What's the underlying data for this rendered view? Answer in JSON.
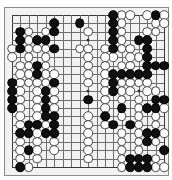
{
  "board": {
    "name": "go-board",
    "size": 19,
    "origin_x": 7,
    "origin_y": 7,
    "spacing": 8.45,
    "board_color": "#f2f2f2",
    "line_color": "#6e6e6e",
    "edge_color": "#3a3a3a",
    "black_color": "#101010",
    "white_color": "#fdfdfd",
    "stone_diameter": 9.6,
    "star_points": [
      [
        3,
        3
      ],
      [
        9,
        3
      ],
      [
        15,
        3
      ],
      [
        3,
        9
      ],
      [
        9,
        9
      ],
      [
        15,
        9
      ],
      [
        3,
        15
      ],
      [
        9,
        15
      ],
      [
        15,
        15
      ]
    ]
  },
  "stones": {
    "black": [
      [
        12,
        0
      ],
      [
        17,
        0
      ],
      [
        8,
        1
      ],
      [
        12,
        1
      ],
      [
        5,
        1
      ],
      [
        1,
        2
      ],
      [
        1,
        3
      ],
      [
        3,
        3
      ],
      [
        4,
        3
      ],
      [
        5,
        2
      ],
      [
        12,
        2
      ],
      [
        12,
        3
      ],
      [
        12,
        4
      ],
      [
        15,
        3
      ],
      [
        16,
        3
      ],
      [
        16,
        4
      ],
      [
        1,
        4
      ],
      [
        5,
        4
      ],
      [
        16,
        5
      ],
      [
        3,
        6
      ],
      [
        3,
        7
      ],
      [
        16,
        6
      ],
      [
        17,
        6
      ],
      [
        18,
        6
      ],
      [
        12,
        7
      ],
      [
        13,
        7
      ],
      [
        14,
        7
      ],
      [
        15,
        7
      ],
      [
        16,
        7
      ],
      [
        0,
        8
      ],
      [
        0,
        9
      ],
      [
        0,
        10
      ],
      [
        0,
        11
      ],
      [
        5,
        8
      ],
      [
        12,
        8
      ],
      [
        12,
        9
      ],
      [
        4,
        9
      ],
      [
        4,
        10
      ],
      [
        4,
        11
      ],
      [
        9,
        10
      ],
      [
        17,
        10
      ],
      [
        18,
        10
      ],
      [
        16,
        11
      ],
      [
        17,
        11
      ],
      [
        4,
        12
      ],
      [
        5,
        12
      ],
      [
        2,
        13
      ],
      [
        3,
        13
      ],
      [
        5,
        13
      ],
      [
        11,
        12
      ],
      [
        13,
        11
      ],
      [
        1,
        14
      ],
      [
        2,
        14
      ],
      [
        4,
        14
      ],
      [
        5,
        14
      ],
      [
        12,
        13
      ],
      [
        14,
        13
      ],
      [
        16,
        14
      ],
      [
        17,
        14
      ],
      [
        2,
        16
      ],
      [
        16,
        15
      ],
      [
        1,
        18
      ],
      [
        14,
        17
      ],
      [
        15,
        17
      ],
      [
        16,
        17
      ],
      [
        14,
        18
      ],
      [
        15,
        18
      ],
      [
        16,
        18
      ],
      [
        18,
        16
      ]
    ],
    "white": [
      [
        13,
        0
      ],
      [
        14,
        0
      ],
      [
        16,
        0
      ],
      [
        18,
        0
      ],
      [
        13,
        1
      ],
      [
        17,
        1
      ],
      [
        18,
        1
      ],
      [
        2,
        2
      ],
      [
        4,
        2
      ],
      [
        9,
        2
      ],
      [
        13,
        2
      ],
      [
        17,
        2
      ],
      [
        2,
        3
      ],
      [
        13,
        3
      ],
      [
        0,
        4
      ],
      [
        2,
        4
      ],
      [
        3,
        4
      ],
      [
        4,
        4
      ],
      [
        8,
        4
      ],
      [
        9,
        4
      ],
      [
        11,
        4
      ],
      [
        12,
        5
      ],
      [
        13,
        4
      ],
      [
        14,
        4
      ],
      [
        16,
        2
      ],
      [
        0,
        5
      ],
      [
        2,
        5
      ],
      [
        4,
        5
      ],
      [
        9,
        5
      ],
      [
        11,
        5
      ],
      [
        14,
        5
      ],
      [
        15,
        5
      ],
      [
        1,
        6
      ],
      [
        2,
        6
      ],
      [
        4,
        6
      ],
      [
        9,
        6
      ],
      [
        11,
        6
      ],
      [
        13,
        6
      ],
      [
        14,
        6
      ],
      [
        1,
        7
      ],
      [
        2,
        7
      ],
      [
        4,
        7
      ],
      [
        5,
        7
      ],
      [
        9,
        7
      ],
      [
        11,
        7
      ],
      [
        1,
        8
      ],
      [
        2,
        8
      ],
      [
        3,
        8
      ],
      [
        4,
        8
      ],
      [
        9,
        8
      ],
      [
        11,
        8
      ],
      [
        13,
        8
      ],
      [
        14,
        8
      ],
      [
        15,
        8
      ],
      [
        16,
        8
      ],
      [
        1,
        9
      ],
      [
        3,
        9
      ],
      [
        5,
        9
      ],
      [
        11,
        9
      ],
      [
        13,
        9
      ],
      [
        14,
        9
      ],
      [
        16,
        9
      ],
      [
        17,
        9
      ],
      [
        1,
        10
      ],
      [
        3,
        10
      ],
      [
        5,
        10
      ],
      [
        11,
        10
      ],
      [
        13,
        10
      ],
      [
        15,
        10
      ],
      [
        1,
        11
      ],
      [
        3,
        11
      ],
      [
        5,
        11
      ],
      [
        11,
        11
      ],
      [
        15,
        11
      ],
      [
        18,
        11
      ],
      [
        1,
        12
      ],
      [
        3,
        12
      ],
      [
        9,
        12
      ],
      [
        13,
        12
      ],
      [
        15,
        12
      ],
      [
        17,
        12
      ],
      [
        1,
        13
      ],
      [
        4,
        13
      ],
      [
        9,
        13
      ],
      [
        11,
        13
      ],
      [
        15,
        13
      ],
      [
        17,
        13
      ],
      [
        3,
        14
      ],
      [
        9,
        14
      ],
      [
        13,
        14
      ],
      [
        15,
        14
      ],
      [
        18,
        14
      ],
      [
        1,
        15
      ],
      [
        3,
        15
      ],
      [
        5,
        15
      ],
      [
        9,
        15
      ],
      [
        13,
        15
      ],
      [
        15,
        15
      ],
      [
        17,
        15
      ],
      [
        1,
        16
      ],
      [
        3,
        16
      ],
      [
        5,
        16
      ],
      [
        9,
        16
      ],
      [
        13,
        16
      ],
      [
        15,
        16
      ],
      [
        1,
        17
      ],
      [
        3,
        17
      ],
      [
        9,
        17
      ],
      [
        13,
        17
      ],
      [
        17,
        17
      ],
      [
        2,
        18
      ],
      [
        13,
        18
      ],
      [
        17,
        18
      ],
      [
        18,
        18
      ]
    ]
  }
}
